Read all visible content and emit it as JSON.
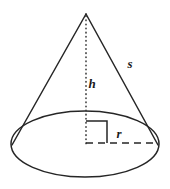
{
  "figure": {
    "name": "cone-geometry-diagram",
    "background_color": "#ffffff",
    "stroke_color": "#262626",
    "label_color": "#1a1a1a"
  },
  "shape": {
    "type": "cone",
    "apex": {
      "x": 86,
      "y": 14
    },
    "base_ellipse": {
      "cx": 85,
      "cy": 144,
      "rx": 74,
      "ry": 33
    },
    "left_slant_endpoint": {
      "x": 12,
      "y": 145
    },
    "right_slant_endpoint": {
      "x": 158,
      "y": 145
    }
  },
  "labels": {
    "height": {
      "text": "h",
      "meaning": "height",
      "x": 93,
      "y": 88
    },
    "slant": {
      "text": "s",
      "meaning": "slant-height",
      "x": 126,
      "y": 68
    },
    "radius": {
      "text": "r",
      "meaning": "radius",
      "x": 115,
      "y": 138
    }
  },
  "annotations": {
    "height_line": {
      "name": "height-dotted-line",
      "style": "dotted",
      "from": {
        "x": 86,
        "y": 16
      },
      "to": {
        "x": 86,
        "y": 145
      }
    },
    "radius_line": {
      "name": "radius-dashed-line",
      "style": "dashed",
      "from": {
        "x": 86,
        "y": 143
      },
      "to": {
        "x": 158,
        "y": 143
      }
    },
    "right_angle": {
      "name": "right-angle-marker",
      "style": "solid",
      "left": 86,
      "top": 121,
      "size": 21
    }
  }
}
